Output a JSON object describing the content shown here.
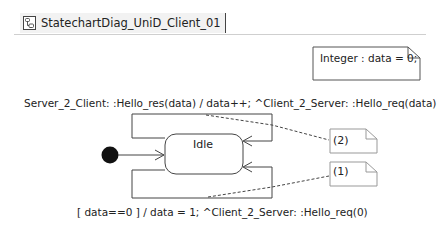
{
  "tab": {
    "icon": "statechart-diagram-icon",
    "title": "StatechartDiag_UniD_Client_01"
  },
  "diagram": {
    "variable_note": "Integer : data = 0;",
    "initial_state": "initial-pseudostate",
    "states": [
      {
        "name": "Idle"
      }
    ],
    "transitions": [
      {
        "id": "(2)",
        "kind": "self-loop-top",
        "label": "Server_2_Client: :Hello_res(data) / data++; ^Client_2_Server: :Hello_req(data)"
      },
      {
        "id": "(1)",
        "kind": "self-loop-bottom",
        "label": "[ data==0 ] / data = 1; ^Client_2_Server: :Hello_req(0)"
      }
    ],
    "notes": [
      {
        "text": "(2)"
      },
      {
        "text": "(1)"
      }
    ]
  }
}
